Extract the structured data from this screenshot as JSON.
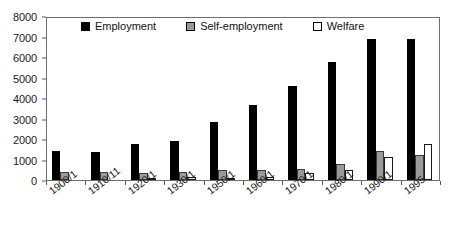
{
  "chart_data": {
    "type": "bar",
    "title": "",
    "subtitle": "",
    "xlabel": "",
    "ylabel": "",
    "ylim": [
      0,
      8000
    ],
    "ytick_step": 1000,
    "yticks": [
      "0",
      "1000",
      "2000",
      "3000",
      "4000",
      "5000",
      "6000",
      "7000",
      "8000"
    ],
    "grid": false,
    "legend_position": "top-inside",
    "categories": [
      "1900/1",
      "1910/11",
      "1920/1",
      "1930/1",
      "1950/1",
      "1960/1",
      "1970/1",
      "1980/1",
      "1990/1",
      "1995"
    ],
    "series": [
      {
        "name": "Employment",
        "color": "#000000",
        "values": [
          1400,
          1350,
          1750,
          1900,
          2850,
          3650,
          4600,
          5750,
          6900,
          6900
        ]
      },
      {
        "name": "Self-employment",
        "color": "#9a9a9a",
        "values": [
          400,
          400,
          350,
          400,
          500,
          500,
          550,
          800,
          1400,
          1200
        ]
      },
      {
        "name": "Welfare",
        "color": "#ffffff",
        "values": [
          0,
          0,
          100,
          150,
          50,
          150,
          350,
          500,
          1100,
          1750
        ]
      }
    ]
  },
  "legend": {
    "items": [
      {
        "label": "Employment",
        "swatch": "black-square-icon"
      },
      {
        "label": "Self-employment",
        "swatch": "grey-square-icon"
      },
      {
        "label": "Welfare",
        "swatch": "white-square-icon"
      }
    ]
  }
}
